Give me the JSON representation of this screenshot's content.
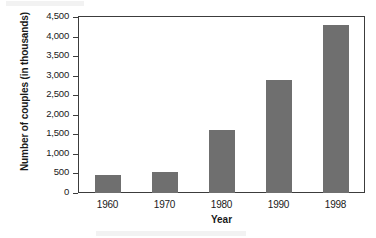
{
  "chart_data": {
    "type": "bar",
    "title": "",
    "xlabel": "Year",
    "ylabel": "Number of couples (in thousands)",
    "categories": [
      "1960",
      "1970",
      "1980",
      "1990",
      "1998"
    ],
    "values": [
      450,
      530,
      1600,
      2900,
      4300
    ],
    "ylim": [
      0,
      4500
    ],
    "ytick_values": [
      0,
      500,
      1000,
      1500,
      2000,
      2500,
      3000,
      3500,
      4000,
      4500
    ],
    "ytick_labels": [
      "0",
      "500",
      "1,000",
      "1,500",
      "2,000",
      "2,500",
      "3,000",
      "3,500",
      "4,000",
      "4,500"
    ],
    "grid": false,
    "legend": null,
    "bar_color": "#6f6f6f",
    "axis_color": "#3c3c3c",
    "background": "#ffffff"
  }
}
